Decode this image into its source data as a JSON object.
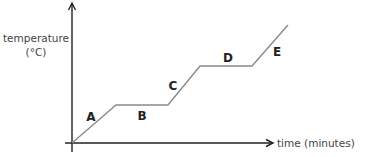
{
  "chart_data": {
    "type": "line",
    "title": "",
    "xlabel": "time (minutes)",
    "ylabel_line1": "temperature",
    "ylabel_line2": "(°C)",
    "grid": false,
    "ticks": "none",
    "legend": "none",
    "points_px": [
      [
        72,
        143
      ],
      [
        116,
        105
      ],
      [
        168,
        105
      ],
      [
        200,
        66
      ],
      [
        252,
        66
      ],
      [
        288,
        25
      ]
    ],
    "segments": [
      {
        "label": "A",
        "phase": "rising",
        "label_pos": [
          91,
          121
        ]
      },
      {
        "label": "B",
        "phase": "plateau",
        "label_pos": [
          142,
          120
        ]
      },
      {
        "label": "C",
        "phase": "rising",
        "label_pos": [
          173,
          90
        ]
      },
      {
        "label": "D",
        "phase": "plateau",
        "label_pos": [
          228,
          62
        ]
      },
      {
        "label": "E",
        "phase": "rising",
        "label_pos": [
          277,
          56
        ]
      }
    ]
  },
  "colors": {
    "axis": "#222222",
    "curve": "#8a8a8a",
    "label_text": "#444444"
  }
}
